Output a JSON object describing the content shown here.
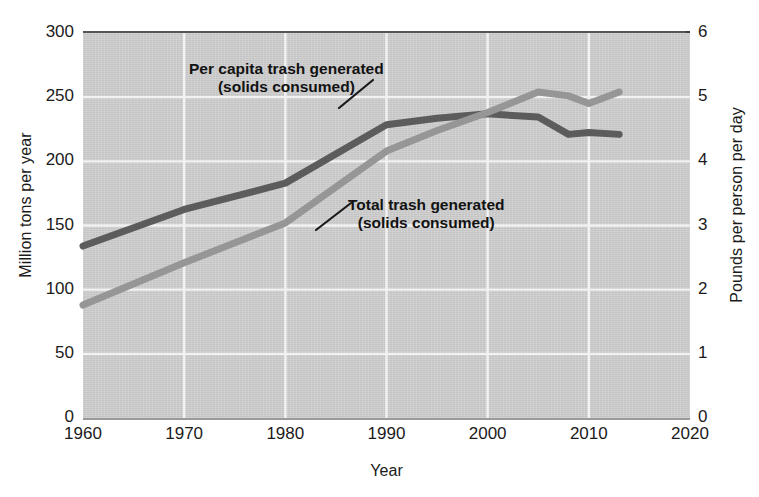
{
  "chart_data": {
    "type": "line",
    "title": "",
    "xlabel": "Year",
    "ylabel": "Million tons per year",
    "ylabel_right": "Pounds per person per day",
    "xlim": [
      1960,
      2020
    ],
    "ylim": [
      0,
      300
    ],
    "ylim_right": [
      0,
      6
    ],
    "xticks": [
      "1960",
      "1970",
      "1980",
      "1990",
      "2000",
      "2010",
      "2020"
    ],
    "xtick_values": [
      1960,
      1970,
      1980,
      1990,
      2000,
      2010,
      2020
    ],
    "yticks_left": [
      "300",
      "250",
      "200",
      "150",
      "100",
      "50",
      "0"
    ],
    "ytick_values_left": [
      300,
      250,
      200,
      150,
      100,
      50,
      0
    ],
    "yticks_right": [
      "6",
      "5",
      "4",
      "3",
      "2",
      "1",
      "0"
    ],
    "ytick_values_right": [
      6,
      5,
      4,
      3,
      2,
      1,
      0
    ],
    "grid": true,
    "grid_color": "#f2f2f2",
    "plot_background": "#cfcfcf",
    "legend": "annotations-on-plot",
    "series": [
      {
        "name": "Per capita trash generated (solids consumed)",
        "axis": "right",
        "units": "Pounds per person per day",
        "color": "#5c5c5c",
        "x": [
          1960,
          1970,
          1980,
          1990,
          1995,
          2000,
          2005,
          2008,
          2010,
          2013
        ],
        "values": [
          2.68,
          3.25,
          3.66,
          4.57,
          4.67,
          4.74,
          4.69,
          4.42,
          4.45,
          4.42
        ]
      },
      {
        "name": "Total trash generated (solids consumed)",
        "axis": "left",
        "units": "Million tons per year",
        "color": "#969696",
        "x": [
          1960,
          1970,
          1980,
          1990,
          1995,
          2000,
          2005,
          2008,
          2010,
          2013
        ],
        "values": [
          88,
          121,
          152,
          208,
          224,
          238,
          254,
          251,
          245,
          254
        ]
      }
    ],
    "annotations": [
      {
        "id": "per-capita",
        "line1": "Per capita trash generated",
        "line2": "(solids consumed)",
        "leader_from": [
          339,
          108
        ],
        "leader_to": [
          373,
          80
        ]
      },
      {
        "id": "total",
        "line1": "Total trash generated",
        "line2": "(solids consumed)",
        "leader_from": [
          316,
          230
        ],
        "leader_to": [
          351,
          203
        ]
      }
    ]
  },
  "axes": {
    "x_title": "Year",
    "y_left_title": "Million tons per year",
    "y_right_title": "Pounds per person per day"
  }
}
